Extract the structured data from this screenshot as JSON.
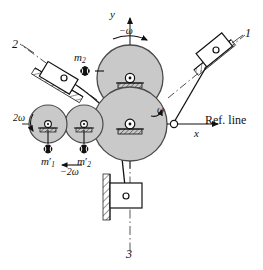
{
  "figure": {
    "type": "mechanism-diagram",
    "background": "#ffffff",
    "stroke_color": "#1a1a1a",
    "disc_fill": "#c9c9c9",
    "disc_stroke": "#4a4a4a",
    "hatch_color": "#3a3a3a"
  },
  "axes": {
    "y_label": "y",
    "x_label": "x",
    "ref_line_label": "Ref. line",
    "y_arrow": "up-arrow",
    "x_arrow": "right-arrow"
  },
  "cylinders": [
    {
      "id": "1",
      "label": "1",
      "angle_deg": 30,
      "name": "cylinder-1-upper-right"
    },
    {
      "id": "2",
      "label": "2",
      "angle_deg": 150,
      "name": "cylinder-2-upper-left"
    },
    {
      "id": "3",
      "label": "3",
      "angle_deg": 270,
      "name": "cylinder-3-bottom"
    }
  ],
  "rotations": [
    {
      "label": "ω",
      "name": "omega-crank",
      "direction": "ccw"
    },
    {
      "label": "−ω",
      "name": "negative-omega-upper-disc",
      "direction": "cw"
    },
    {
      "label": "2ω",
      "name": "two-omega-left-gear",
      "direction": "ccw"
    },
    {
      "label": "−2ω",
      "name": "negative-two-omega-gear",
      "direction": "cw"
    }
  ],
  "masses": [
    {
      "id": "m2",
      "base": "m",
      "sub": "2",
      "prime": false,
      "name": "mass-m2",
      "note": "upper balance mass"
    },
    {
      "id": "m1prime",
      "base": "m",
      "sub": "1",
      "prime": true,
      "name": "mass-m1-prime",
      "note": "secondary balance mass 1"
    },
    {
      "id": "m2prime",
      "base": "m",
      "sub": "2",
      "prime": true,
      "name": "mass-m2-prime",
      "note": "secondary balance mass 2"
    }
  ],
  "discs": [
    {
      "name": "upper-main-disc",
      "cx": 130,
      "cy": 78,
      "r": 32,
      "grounded": true
    },
    {
      "name": "lower-main-disc",
      "cx": 130,
      "cy": 131,
      "r": 36,
      "grounded": true
    },
    {
      "name": "left-gear-inner",
      "cx": 80,
      "cy": 124,
      "r": 18,
      "grounded": true
    },
    {
      "name": "left-gear-outer",
      "cx": 45,
      "cy": 124,
      "r": 18,
      "grounded": true
    }
  ],
  "sliders": [
    {
      "name": "slider-block-1",
      "cx": 213,
      "cy": 52,
      "angle_deg": -28
    },
    {
      "name": "slider-block-2",
      "cx": 58,
      "cy": 78,
      "angle_deg": 22
    },
    {
      "name": "slider-block-3",
      "cx": 120,
      "cy": 196,
      "angle_deg": 90
    }
  ],
  "crank_pin": {
    "name": "crank-pin",
    "x": 173,
    "y": 124
  }
}
